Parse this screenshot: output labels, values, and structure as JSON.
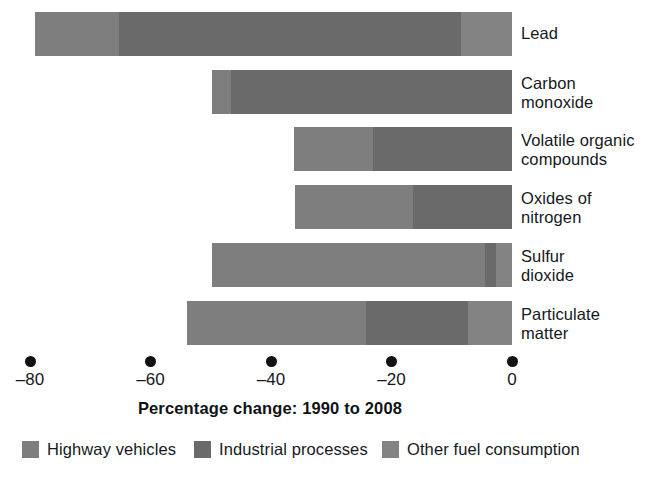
{
  "chart_data": {
    "type": "bar",
    "orientation": "horizontal",
    "stacked": true,
    "title": "",
    "xlabel": "Percentage change: 1990 to 2008",
    "ylabel": "",
    "xlim": [
      -86,
      2
    ],
    "xticks": [
      -80,
      -60,
      -40,
      -20,
      0
    ],
    "xtick_labels": [
      "–80",
      "–60",
      "–40",
      "–20",
      "0"
    ],
    "grid": false,
    "legend_position": "bottom",
    "categories": [
      "Lead",
      "Carbon monoxide",
      "Volatile organic compounds",
      "Oxides of nitrogen",
      "Sulfur dioxide",
      "Particulate matter"
    ],
    "category_labels": [
      [
        "Lead"
      ],
      [
        "Carbon",
        "monoxide"
      ],
      [
        "Volatile organic",
        "compounds"
      ],
      [
        "Oxides of",
        "nitrogen"
      ],
      [
        "Sulfur",
        "dioxide"
      ],
      [
        "Particulate",
        "matter"
      ]
    ],
    "series": [
      {
        "name": "Highway vehicles",
        "color": "#7e7e7e",
        "values": [
          -13.9,
          -3.2,
          -13.1,
          -19.6,
          -45.3,
          -29.7
        ]
      },
      {
        "name": "Industrial processes",
        "color": "#6a6a6a",
        "values": [
          -56.9,
          -46.6,
          -23.1,
          -16.4,
          -1.8,
          -16.9
        ]
      },
      {
        "name": "Other fuel consumption",
        "color": "#838383",
        "values": [
          -8.4,
          0.0,
          0.0,
          0.0,
          -2.7,
          -7.3
        ]
      }
    ],
    "totals": [
      -79.2,
      -49.8,
      -36.2,
      -36.0,
      -49.8,
      -53.9
    ],
    "annotations": []
  },
  "legend": {
    "items": [
      {
        "label": "Highway vehicles",
        "color": "#7e7e7e"
      },
      {
        "label": "Industrial processes",
        "color": "#6a6a6a"
      },
      {
        "label": "Other fuel consumption",
        "color": "#838383"
      }
    ]
  },
  "axis": {
    "title": "Percentage change: 1990 to 2008",
    "tick_labels": [
      "–80",
      "–60",
      "–40",
      "–20",
      "0"
    ]
  }
}
